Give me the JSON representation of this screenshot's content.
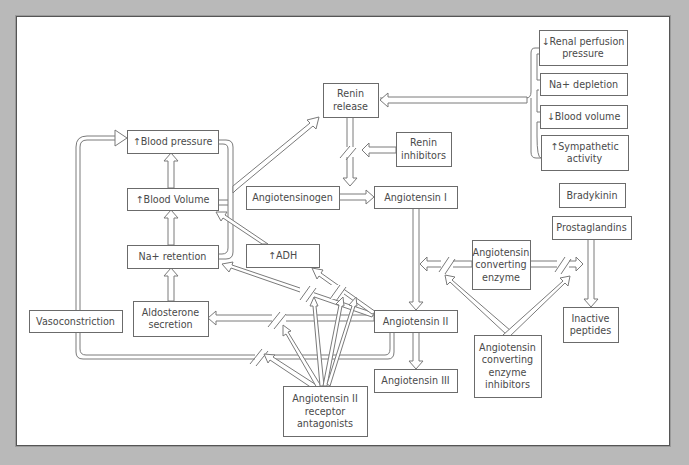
{
  "diagram": {
    "colors": {
      "background": "#b9b9b9",
      "panel": "#ffffff",
      "stroke": "#6b6b6b",
      "text": "#4a4a4a"
    },
    "nodes": {
      "renal_perfusion": {
        "lines": [
          "↓Renal perfusion",
          "pressure"
        ],
        "x": 539,
        "y": 30,
        "w": 88,
        "h": 35
      },
      "na_depletion": {
        "lines": [
          "Na+ depletion"
        ],
        "x": 540,
        "y": 73,
        "w": 87,
        "h": 22
      },
      "low_blood_volume": {
        "lines": [
          "↓Blood volume"
        ],
        "x": 540,
        "y": 105,
        "w": 87,
        "h": 23
      },
      "sympathetic": {
        "lines": [
          "↑Sympathetic",
          "activity"
        ],
        "x": 541,
        "y": 135,
        "w": 87,
        "h": 35
      },
      "renin_release": {
        "lines": [
          "Renin",
          "release"
        ],
        "x": 323,
        "y": 83,
        "w": 55,
        "h": 34
      },
      "renin_inhibitors": {
        "lines": [
          "Renin",
          "inhibitors"
        ],
        "x": 396,
        "y": 132,
        "w": 55,
        "h": 34
      },
      "blood_pressure": {
        "lines": [
          "↑Blood pressure"
        ],
        "x": 127,
        "y": 130,
        "w": 91,
        "h": 23
      },
      "blood_volume_up": {
        "lines": [
          "↑Blood Volume"
        ],
        "x": 127,
        "y": 188,
        "w": 91,
        "h": 22
      },
      "angiotensinogen": {
        "lines": [
          "Angiotensinogen"
        ],
        "x": 246,
        "y": 186,
        "w": 93,
        "h": 23
      },
      "angiotensin_1": {
        "lines": [
          "Angiotensin I"
        ],
        "x": 374,
        "y": 186,
        "w": 83,
        "h": 22
      },
      "bradykinin": {
        "lines": [
          "Bradykinin"
        ],
        "x": 559,
        "y": 183,
        "w": 66,
        "h": 24
      },
      "prostaglandins": {
        "lines": [
          "Prostaglandins"
        ],
        "x": 552,
        "y": 216,
        "w": 79,
        "h": 23
      },
      "na_retention": {
        "lines": [
          "Na+ retention"
        ],
        "x": 127,
        "y": 245,
        "w": 91,
        "h": 23
      },
      "adh": {
        "lines": [
          "↑ADH"
        ],
        "x": 246,
        "y": 244,
        "w": 73,
        "h": 23
      },
      "ace": {
        "lines": [
          "Angiotensin",
          "converting",
          "enzyme"
        ],
        "x": 472,
        "y": 240,
        "w": 58,
        "h": 49
      },
      "vasoconstriction": {
        "lines": [
          "Vasoconstriction"
        ],
        "x": 29,
        "y": 310,
        "w": 93,
        "h": 22
      },
      "aldosterone": {
        "lines": [
          "Aldosterone",
          "secretion"
        ],
        "x": 133,
        "y": 301,
        "w": 75,
        "h": 35
      },
      "angiotensin_2": {
        "lines": [
          "Angiotensin II"
        ],
        "x": 374,
        "y": 310,
        "w": 83,
        "h": 22
      },
      "inactive_peptides": {
        "lines": [
          "Inactive",
          "peptides"
        ],
        "x": 563,
        "y": 307,
        "w": 55,
        "h": 35
      },
      "angiotensin_3": {
        "lines": [
          "Angiotensin III"
        ],
        "x": 374,
        "y": 369,
        "w": 83,
        "h": 23
      },
      "ace_inhibitors": {
        "lines": [
          "Angiotensin",
          "converting",
          "enzyme",
          "inhibitors"
        ],
        "x": 474,
        "y": 335,
        "w": 67,
        "h": 62
      },
      "at2_antagonists": {
        "lines": [
          "Angiotensin II",
          "receptor",
          "antagonists"
        ],
        "x": 283,
        "y": 386,
        "w": 84,
        "h": 50
      }
    }
  }
}
